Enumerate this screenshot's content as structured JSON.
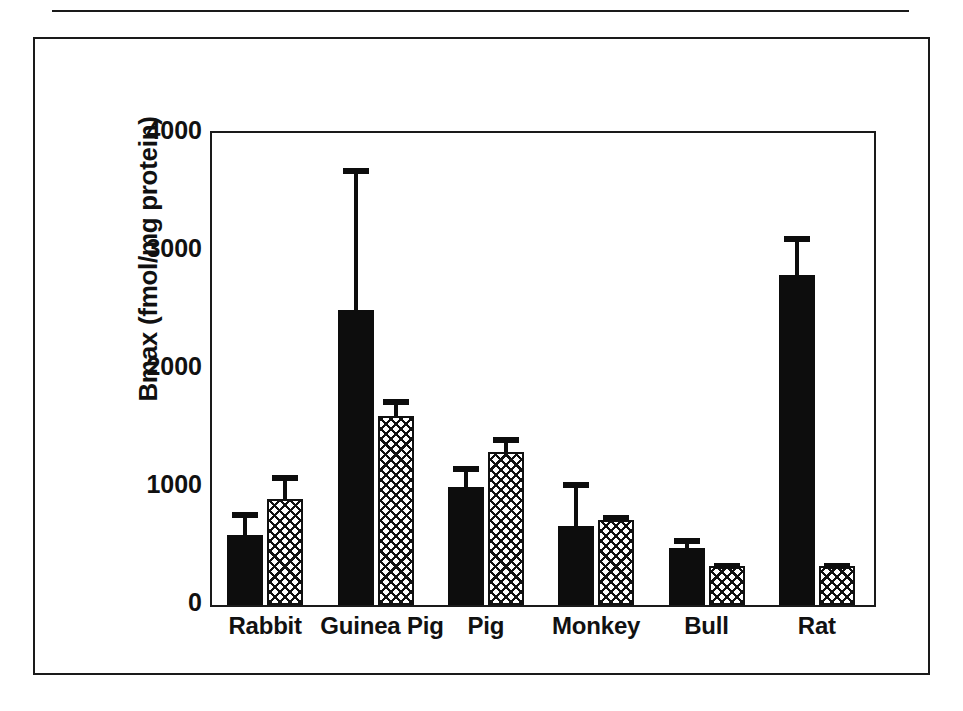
{
  "page": {
    "clipped_caption": "clipped running-head text above horizontal rule"
  },
  "chart_data": {
    "type": "bar",
    "title": "",
    "xlabel": "",
    "ylabel": "Bmax (fmol/mg protein)",
    "ylim": [
      0,
      4000
    ],
    "ytick_labels": [
      "4000",
      "3000",
      "2000",
      "1000",
      "0"
    ],
    "ytick_values": [
      4000,
      3000,
      2000,
      1000,
      0
    ],
    "grid": false,
    "legend": "none",
    "categories": [
      "Rabbit",
      "Guinea Pig",
      "Pig",
      "Monkey",
      "Bull",
      "Rat"
    ],
    "series": [
      {
        "name": "solid-black",
        "fill": "solid black",
        "values": [
          590,
          2500,
          1000,
          670,
          480,
          2800
        ],
        "errors_upper": [
          790,
          3700,
          1180,
          1040,
          570,
          3130
        ]
      },
      {
        "name": "cross-hatched",
        "fill": "cross-hatch",
        "values": [
          900,
          1600,
          1300,
          720,
          330,
          330
        ],
        "errors_upper": [
          1100,
          1750,
          1420,
          760,
          355,
          355
        ]
      }
    ]
  },
  "colors": {
    "ink": "#1a1a1a",
    "bar_solid": "#0d0d0d",
    "background": "#ffffff"
  }
}
